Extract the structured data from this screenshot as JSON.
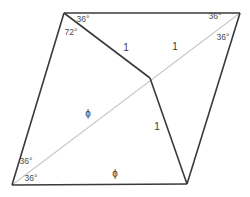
{
  "figure": {
    "type": "geometric-diagram",
    "width": 250,
    "height": 197,
    "background_color": "#ffffff",
    "stroke_color_solid": "#3a3a3a",
    "stroke_color_diagonal": "#c8c8c8",
    "points": {
      "top_left": [
        64,
        13
      ],
      "top_right": [
        240,
        13
      ],
      "bottom_left": [
        12,
        185
      ],
      "bottom_right": [
        187,
        184
      ],
      "interior": [
        150,
        78
      ]
    },
    "edges": [
      {
        "name": "top-edge",
        "from": "top_left",
        "to": "top_right",
        "style": "solid"
      },
      {
        "name": "left-edge",
        "from": "top_left",
        "to": "bottom_left",
        "style": "solid"
      },
      {
        "name": "bottom-edge",
        "from": "bottom_left",
        "to": "bottom_right",
        "style": "solid"
      },
      {
        "name": "right-edge",
        "from": "bottom_right",
        "to": "top_right",
        "style": "solid"
      },
      {
        "name": "upper-chord",
        "from": "top_left",
        "to": "interior",
        "style": "solid"
      },
      {
        "name": "lower-chord",
        "from": "interior",
        "to": "bottom_right",
        "style": "solid"
      },
      {
        "name": "main-diagonal",
        "from": "bottom_left",
        "to": "top_right",
        "style": "light"
      }
    ],
    "labels": [
      {
        "id": "angle-top-left-36",
        "text": "36°",
        "kind": "angle",
        "x": 83,
        "y": 19
      },
      {
        "id": "angle-top-left-72",
        "text": "72°",
        "kind": "angle",
        "x": 71,
        "y": 32
      },
      {
        "id": "angle-top-right-36-upper",
        "text": "36°",
        "kind": "angle",
        "x": 215,
        "y": 16
      },
      {
        "id": "angle-top-right-36-lower",
        "text": "36°",
        "kind": "angle",
        "x": 223,
        "y": 37
      },
      {
        "id": "angle-bottom-left-36-upper",
        "text": "36°",
        "kind": "angle",
        "x": 26,
        "y": 161
      },
      {
        "id": "angle-bottom-left-36-lower",
        "text": "36°",
        "kind": "angle",
        "x": 31,
        "y": 178
      },
      {
        "id": "length-upper-left-1",
        "text": "1",
        "kind": "length",
        "x": 126,
        "y": 48
      },
      {
        "id": "length-upper-right-1",
        "text": "1",
        "kind": "length",
        "x": 175,
        "y": 47
      },
      {
        "id": "length-lower-1",
        "text": "1",
        "kind": "length",
        "x": 157,
        "y": 127
      },
      {
        "id": "length-diagonal-phi",
        "text": "ϕ",
        "kind": "length",
        "x": 88,
        "y": 114
      },
      {
        "id": "length-bottom-phi",
        "text": "ϕ",
        "kind": "length",
        "x": 115,
        "y": 174
      }
    ]
  }
}
